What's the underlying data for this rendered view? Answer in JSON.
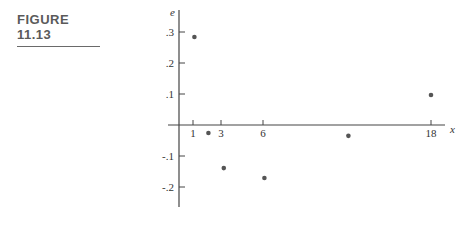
{
  "figure": {
    "label": "FIGURE 11.13"
  },
  "chart_data": {
    "type": "scatter",
    "title": "",
    "xlabel": "x",
    "ylabel": "e",
    "x_ticks": [
      1,
      3,
      6,
      18
    ],
    "x_tick_labels": [
      "1",
      "3",
      "6",
      "18"
    ],
    "y_ticks": [
      0.3,
      0.2,
      0.1,
      -0.1,
      -0.2
    ],
    "y_tick_labels": [
      ".3",
      ".2",
      ".1",
      "-.1",
      "-.2"
    ],
    "xlim": [
      0,
      19
    ],
    "ylim": [
      -0.26,
      0.33
    ],
    "grid": false,
    "legend": null,
    "series": [
      {
        "name": "residuals",
        "points": [
          {
            "x": 1.1,
            "y": 0.284
          },
          {
            "x": 2.1,
            "y": -0.026
          },
          {
            "x": 3.2,
            "y": -0.139
          },
          {
            "x": 6.1,
            "y": -0.171
          },
          {
            "x": 12.1,
            "y": -0.035
          },
          {
            "x": 18.0,
            "y": 0.097
          }
        ]
      }
    ]
  }
}
